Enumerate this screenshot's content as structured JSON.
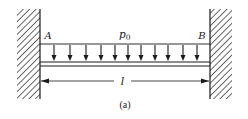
{
  "figure": {
    "caption": "(a)",
    "colors": {
      "ink": "#1a1a1a",
      "background": "#ffffff"
    }
  },
  "labels": {
    "end_left": "A",
    "end_right": "B",
    "load": "p",
    "load_subscript": "0",
    "span": "l"
  },
  "geometry": {
    "left_wall": {
      "x": 17,
      "y": 9,
      "width": 23,
      "height": 90
    },
    "right_wall": {
      "x": 210,
      "y": 9,
      "width": 22,
      "height": 90
    },
    "load_top_y": 44,
    "beam_top_y": 62,
    "beam_bottom_y": 66,
    "dimension_y": 81,
    "arrow_x": [
      54,
      70,
      86,
      101,
      115,
      128,
      141,
      155,
      168,
      183,
      197
    ],
    "arrow_count": 11
  }
}
